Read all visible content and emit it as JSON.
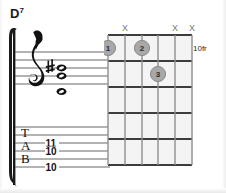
{
  "chord": {
    "root": "D",
    "quality_superscript": "7",
    "full_name": "D7"
  },
  "notation": {
    "clef": "treble-clef",
    "staff_lines": 5,
    "notes": [
      {
        "name": "whole-note",
        "accidental": "sharp",
        "staff_y": 44
      },
      {
        "name": "whole-note",
        "accidental": "none",
        "staff_y": 52
      },
      {
        "name": "whole-note",
        "accidental": "none",
        "staff_y": 68
      }
    ],
    "tab": {
      "label_letters": [
        "T",
        "A",
        "B"
      ],
      "lines": 6,
      "numbers": [
        {
          "value": "11",
          "string_index": 1
        },
        {
          "value": "10",
          "string_index": 2
        },
        {
          "value": "10",
          "string_index": 4
        }
      ]
    }
  },
  "diagram": {
    "position_label": "10fr",
    "strings": 6,
    "frets": 5,
    "muted_marker": "X",
    "muted_strings": [
      2,
      5,
      6
    ],
    "finger_dots": [
      {
        "label": "1",
        "string": 1,
        "fret": 1
      },
      {
        "label": "2",
        "string": 3,
        "fret": 1
      },
      {
        "label": "3",
        "string": 4,
        "fret": 2
      }
    ]
  },
  "colors": {
    "ink": "#1a1a1a",
    "grid": "#3d3d3d",
    "dot_fill": "#a8a8a8",
    "dot_stroke": "#8a8a8a",
    "muted_mark": "#7a7a7a",
    "cell_fill": "#f4f4f4",
    "background": "#ffffff"
  }
}
